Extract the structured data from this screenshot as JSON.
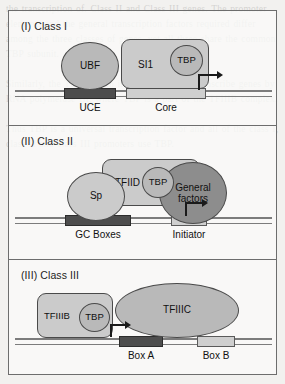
{
  "background_text": "the transcription of. Class II and Class III genes. The promoter elements and the general transcription factors required differ among the three classes of genes, yet all three share the common TBP subunit.\n\nSimilarly, the TBP protein is also required to transcribe genes by RNA polymerase III, where TBP is a part of the TFIIIB complex.\n\nThus TBP is a universal transcription factor and all of the class I, class II and class III promoters use TBP.",
  "figure": {
    "border_color": "#6d6d6d",
    "panels": [
      {
        "id": "class-i",
        "title": "(I) Class I",
        "shapes": [
          {
            "name": "ubf-protein",
            "label": "UBF",
            "type": "ellipse",
            "fill": "#b9b9b9"
          },
          {
            "name": "sl1-complex",
            "label": "SI1",
            "type": "rounded-rect",
            "fill": "#c4c4c4"
          },
          {
            "name": "tbp-subunit",
            "label": "TBP",
            "type": "ellipse",
            "fill": "#b2b2b2"
          }
        ],
        "dna_elements": [
          {
            "name": "uce-element",
            "label": "UCE",
            "shade": "dark"
          },
          {
            "name": "core-element",
            "label": "Core",
            "shade": "light"
          }
        ],
        "arrow": "transcription-start-arrow"
      },
      {
        "id": "class-ii",
        "title": "(II) Class II",
        "shapes": [
          {
            "name": "sp-protein",
            "label": "Sp",
            "type": "ellipse",
            "fill": "#c0c0c0"
          },
          {
            "name": "tfiid-complex",
            "label": "TFIID",
            "type": "rounded-rect",
            "fill": "#c9c9c9"
          },
          {
            "name": "tbp-subunit",
            "label": "TBP",
            "type": "ellipse",
            "fill": "#bdbdbd"
          },
          {
            "name": "general-factors",
            "label": "General factors",
            "type": "ellipse",
            "fill": "#8d8d8d"
          }
        ],
        "dna_elements": [
          {
            "name": "gc-boxes-element",
            "label": "GC Boxes",
            "shade": "dark"
          },
          {
            "name": "initiator-element",
            "label": "Initiator",
            "shade": "light"
          }
        ],
        "arrow": "transcription-start-arrow"
      },
      {
        "id": "class-iii",
        "title": "(III) Class III",
        "shapes": [
          {
            "name": "tfiiib-complex",
            "label": "TFIIIB",
            "type": "rounded-rect",
            "fill": "#c4c4c4"
          },
          {
            "name": "tbp-subunit",
            "label": "TBP",
            "type": "ellipse",
            "fill": "#b2b2b2"
          },
          {
            "name": "tfiiic-complex",
            "label": "TFIIIC",
            "type": "ellipse",
            "fill": "#b9b9b9"
          }
        ],
        "dna_elements": [
          {
            "name": "box-a-element",
            "label": "Box A",
            "shade": "dark"
          },
          {
            "name": "box-b-element",
            "label": "Box B",
            "shade": "light"
          }
        ],
        "arrow": "transcription-start-arrow"
      }
    ]
  }
}
